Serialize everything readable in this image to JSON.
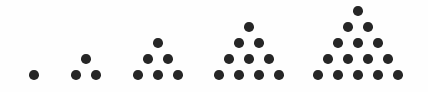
{
  "image": {
    "title": "Triangular numbers dot pattern sequence",
    "background_color": "#fefefe",
    "dot_color": "#262626",
    "width": 428,
    "height": 92
  },
  "chart_data": {
    "type": "scatter",
    "subtitle": "",
    "xlabel": "",
    "ylabel": "",
    "grid": false,
    "legend": "none",
    "xlim": [
      0,
      428
    ],
    "ylim": [
      92,
      0
    ],
    "categories": [
      "T1",
      "T2",
      "T3",
      "T4",
      "T5"
    ],
    "values": [
      1,
      3,
      6,
      10,
      15
    ],
    "annotations": [],
    "dot_radius": 4.8,
    "row_spacing": 16.2,
    "column_spacing": 19.6,
    "figures": [
      {
        "name": "figure-1",
        "index": 1,
        "rows": 1,
        "dot_count": 1,
        "baseline_y": 75,
        "apex_x": 34,
        "dots": [
          {
            "x": 34,
            "y": 75
          }
        ]
      },
      {
        "name": "figure-2",
        "index": 2,
        "rows": 2,
        "dot_count": 3,
        "baseline_y": 75,
        "apex_x": 86,
        "dots": [
          {
            "x": 86,
            "y": 59
          },
          {
            "x": 76,
            "y": 75
          },
          {
            "x": 96,
            "y": 75
          }
        ]
      },
      {
        "name": "figure-3",
        "index": 3,
        "rows": 3,
        "dot_count": 6,
        "baseline_y": 75,
        "apex_x": 158,
        "dots": [
          {
            "x": 158,
            "y": 43
          },
          {
            "x": 148,
            "y": 59
          },
          {
            "x": 168,
            "y": 59
          },
          {
            "x": 138,
            "y": 75
          },
          {
            "x": 158,
            "y": 75
          },
          {
            "x": 178,
            "y": 75
          }
        ]
      },
      {
        "name": "figure-4",
        "index": 4,
        "rows": 4,
        "dot_count": 10,
        "baseline_y": 75,
        "apex_x": 249,
        "dots": [
          {
            "x": 249,
            "y": 27
          },
          {
            "x": 239,
            "y": 43
          },
          {
            "x": 259,
            "y": 43
          },
          {
            "x": 229,
            "y": 59
          },
          {
            "x": 249,
            "y": 59
          },
          {
            "x": 269,
            "y": 59
          },
          {
            "x": 219,
            "y": 75
          },
          {
            "x": 239,
            "y": 75
          },
          {
            "x": 259,
            "y": 75
          },
          {
            "x": 279,
            "y": 75
          }
        ]
      },
      {
        "name": "figure-5",
        "index": 5,
        "rows": 5,
        "dot_count": 15,
        "baseline_y": 75,
        "apex_x": 358,
        "dots": [
          {
            "x": 358,
            "y": 11
          },
          {
            "x": 348,
            "y": 27
          },
          {
            "x": 368,
            "y": 27
          },
          {
            "x": 338,
            "y": 43
          },
          {
            "x": 358,
            "y": 43
          },
          {
            "x": 378,
            "y": 43
          },
          {
            "x": 328,
            "y": 59
          },
          {
            "x": 348,
            "y": 59
          },
          {
            "x": 368,
            "y": 59
          },
          {
            "x": 388,
            "y": 59
          },
          {
            "x": 318,
            "y": 75
          },
          {
            "x": 338,
            "y": 75
          },
          {
            "x": 358,
            "y": 75
          },
          {
            "x": 378,
            "y": 75
          },
          {
            "x": 398,
            "y": 75
          }
        ]
      }
    ]
  }
}
